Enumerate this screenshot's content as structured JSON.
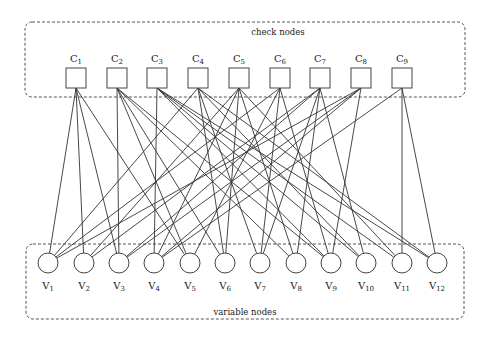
{
  "groups": {
    "check": {
      "label": "check nodes",
      "x": 25,
      "y": 22,
      "w": 440,
      "h": 75,
      "label_x": 278,
      "label_y": 35
    },
    "variable": {
      "label": "variable nodes",
      "x": 26,
      "y": 244,
      "w": 438,
      "h": 75,
      "label_x": 245,
      "label_y": 315
    }
  },
  "check_nodes": [
    {
      "id": "C1",
      "base": "C",
      "sub": "1",
      "cx": 76
    },
    {
      "id": "C2",
      "base": "C",
      "sub": "2",
      "cx": 117
    },
    {
      "id": "C3",
      "base": "C",
      "sub": "3",
      "cx": 157
    },
    {
      "id": "C4",
      "base": "C",
      "sub": "4",
      "cx": 198
    },
    {
      "id": "C5",
      "base": "C",
      "sub": "5",
      "cx": 239
    },
    {
      "id": "C6",
      "base": "C",
      "sub": "6",
      "cx": 280
    },
    {
      "id": "C7",
      "base": "C",
      "sub": "7",
      "cx": 320
    },
    {
      "id": "C8",
      "base": "C",
      "sub": "8",
      "cx": 361
    },
    {
      "id": "C9",
      "base": "C",
      "sub": "9",
      "cx": 402
    }
  ],
  "check_geom": {
    "top": 68,
    "size": 20,
    "label_y": 62
  },
  "variable_nodes": [
    {
      "id": "V1",
      "base": "V",
      "sub": "1",
      "cx": 48
    },
    {
      "id": "V2",
      "base": "V",
      "sub": "2",
      "cx": 84
    },
    {
      "id": "V3",
      "base": "V",
      "sub": "3",
      "cx": 119
    },
    {
      "id": "V4",
      "base": "V",
      "sub": "4",
      "cx": 154
    },
    {
      "id": "V5",
      "base": "V",
      "sub": "5",
      "cx": 190
    },
    {
      "id": "V6",
      "base": "V",
      "sub": "6",
      "cx": 225
    },
    {
      "id": "V7",
      "base": "V",
      "sub": "7",
      "cx": 260
    },
    {
      "id": "V8",
      "base": "V",
      "sub": "8",
      "cx": 296
    },
    {
      "id": "V9",
      "base": "V",
      "sub": "9",
      "cx": 331
    },
    {
      "id": "V10",
      "base": "V",
      "sub": "10",
      "cx": 366
    },
    {
      "id": "V11",
      "base": "V",
      "sub": "11",
      "cx": 402
    },
    {
      "id": "V12",
      "base": "V",
      "sub": "12",
      "cx": 437
    }
  ],
  "variable_geom": {
    "cy": 263,
    "r": 10,
    "label_y": 289
  },
  "edges": [
    [
      "C1",
      "V1"
    ],
    [
      "C1",
      "V2"
    ],
    [
      "C1",
      "V3"
    ],
    [
      "C1",
      "V5"
    ],
    [
      "C2",
      "V3"
    ],
    [
      "C2",
      "V5"
    ],
    [
      "C2",
      "V6"
    ],
    [
      "C2",
      "V8"
    ],
    [
      "C2",
      "V9"
    ],
    [
      "C3",
      "V4"
    ],
    [
      "C3",
      "V9"
    ],
    [
      "C3",
      "V10"
    ],
    [
      "C3",
      "V11"
    ],
    [
      "C3",
      "V12"
    ],
    [
      "C4",
      "V1"
    ],
    [
      "C4",
      "V6"
    ],
    [
      "C4",
      "V7"
    ],
    [
      "C4",
      "V10"
    ],
    [
      "C4",
      "V12"
    ],
    [
      "C5",
      "V2"
    ],
    [
      "C5",
      "V4"
    ],
    [
      "C5",
      "V6"
    ],
    [
      "C5",
      "V8"
    ],
    [
      "C5",
      "V11"
    ],
    [
      "C6",
      "V1"
    ],
    [
      "C6",
      "V5"
    ],
    [
      "C6",
      "V7"
    ],
    [
      "C6",
      "V9"
    ],
    [
      "C7",
      "V2"
    ],
    [
      "C7",
      "V3"
    ],
    [
      "C7",
      "V7"
    ],
    [
      "C7",
      "V8"
    ],
    [
      "C7",
      "V10"
    ],
    [
      "C8",
      "V1"
    ],
    [
      "C8",
      "V3"
    ],
    [
      "C8",
      "V4"
    ],
    [
      "C8",
      "V9"
    ],
    [
      "C9",
      "V4"
    ],
    [
      "C9",
      "V11"
    ],
    [
      "C9",
      "V12"
    ]
  ]
}
